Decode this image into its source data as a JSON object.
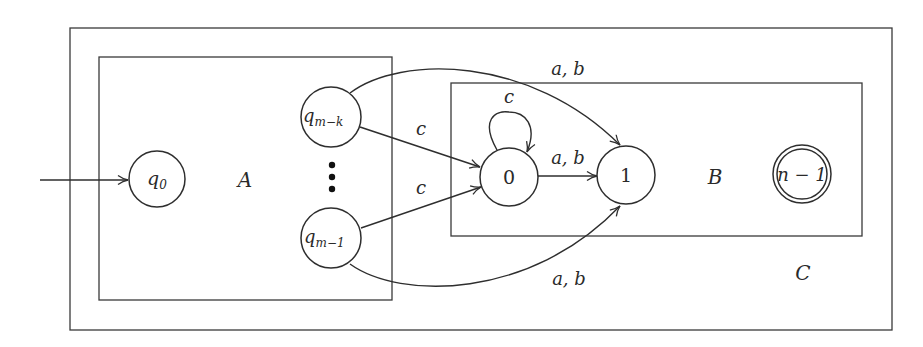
{
  "diagram": {
    "type": "finite-automaton",
    "regions": [
      {
        "id": "C",
        "label": "C"
      },
      {
        "id": "A",
        "label": "A"
      },
      {
        "id": "B",
        "label": "B"
      }
    ],
    "states": [
      {
        "id": "q0",
        "base": "q",
        "subscript": "0",
        "initial": true,
        "accepting": false,
        "region": "A"
      },
      {
        "id": "qmk",
        "base": "q",
        "subscript": "m−k",
        "initial": false,
        "accepting": false,
        "region": "A"
      },
      {
        "id": "qm1",
        "base": "q",
        "subscript": "m−1",
        "initial": false,
        "accepting": false,
        "region": "A"
      },
      {
        "id": "s0",
        "label": "0",
        "initial": false,
        "accepting": false,
        "region": "B"
      },
      {
        "id": "s1",
        "label": "1",
        "initial": false,
        "accepting": false,
        "region": "B"
      },
      {
        "id": "sn1",
        "label": "n − 1",
        "initial": false,
        "accepting": true,
        "region": "B"
      }
    ],
    "ellipsis": "⋮",
    "transitions": [
      {
        "from": "start",
        "to": "q0",
        "label": ""
      },
      {
        "from": "qmk",
        "to": "s0",
        "label": "c"
      },
      {
        "from": "qm1",
        "to": "s0",
        "label": "c"
      },
      {
        "from": "s0",
        "to": "s0",
        "label": "c"
      },
      {
        "from": "s0",
        "to": "s1",
        "label": "a, b"
      },
      {
        "from": "qmk",
        "to": "s1",
        "label": "a, b"
      },
      {
        "from": "qm1",
        "to": "s1",
        "label": "a, b"
      }
    ],
    "labels": {
      "region_A": "A",
      "region_B": "B",
      "region_C": "C",
      "q_base": "q",
      "q0_sub": "0",
      "qmk_sub": "m−k",
      "qm1_sub": "m−1",
      "state_0": "0",
      "state_1": "1",
      "state_n1": "n − 1",
      "edge_qmk_0": "c",
      "edge_qm1_0": "c",
      "edge_loop_0": "c",
      "edge_0_1": "a, b",
      "edge_qmk_1": "a, b",
      "edge_qm1_1": "a, b"
    }
  }
}
